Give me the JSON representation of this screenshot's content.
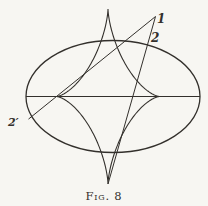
{
  "figure": {
    "caption": "Fig. 8",
    "labels": {
      "point_1": "1",
      "line_2": "2",
      "line_2_prime": "2′"
    },
    "colors": {
      "paper": "#f7f6f2",
      "ink": "#33302c"
    },
    "geometry": {
      "ellipse": {
        "cx": 113,
        "cy": 96.5,
        "rx": 87,
        "ry": 56
      },
      "astroid_envelope": {
        "cx": 108,
        "cy": 96.5,
        "ax": 51.5,
        "ay": 87.5
      },
      "major_axis_line": {
        "x1": 26,
        "y1": 96.5,
        "x2": 200,
        "y2": 96.5
      },
      "tangent_line_2": {
        "x1": 155.5,
        "y1": 16.5,
        "x2": 108,
        "y2": 184
      },
      "tangent_line_2_prime": {
        "x1": 155.5,
        "y1": 16.5,
        "x2": 28.5,
        "y2": 119.1
      },
      "stroke_widths": {
        "ellipse": 1.3,
        "astroid": 1.1,
        "axis": 1.0,
        "tangents": 1.0
      }
    }
  }
}
